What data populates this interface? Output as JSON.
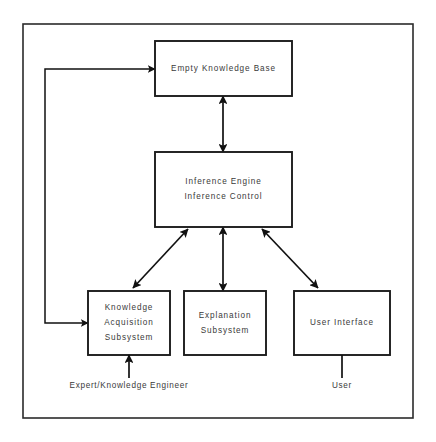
{
  "diagram": {
    "canvas": {
      "width": 436,
      "height": 442
    },
    "frame": {
      "x": 23,
      "y": 24,
      "width": 390,
      "height": 394
    },
    "colors": {
      "background": "#ffffff",
      "box_stroke": "#1c1c1c",
      "frame_stroke": "#2b2b2b",
      "arrow_stroke": "#111111",
      "text": "#3a3a3a"
    },
    "nodes": [
      {
        "id": "empty-knowledge-base",
        "name": "Empty Knowledge Base",
        "lines": [
          "Empty Knowledge Base"
        ],
        "x": 155,
        "y": 41,
        "width": 137,
        "height": 55
      },
      {
        "id": "inference-engine",
        "name": "Inference Engine",
        "lines": [
          "Inference Engine",
          "Inference Control"
        ],
        "x": 155,
        "y": 152,
        "width": 137,
        "height": 75
      },
      {
        "id": "knowledge-acquisition-subsystem",
        "name": "Knowledge Acquisition Subsystem",
        "lines": [
          "Knowledge",
          "Acquisition",
          "Subsystem"
        ],
        "x": 88,
        "y": 291,
        "width": 82,
        "height": 64
      },
      {
        "id": "explanation-subsystem",
        "name": "Explanation Subsystem",
        "lines": [
          "Explanation",
          "Subsystem"
        ],
        "x": 184,
        "y": 291,
        "width": 82,
        "height": 64
      },
      {
        "id": "user-interface",
        "name": "User Interface",
        "lines": [
          "User Interface"
        ],
        "x": 294,
        "y": 291,
        "width": 96,
        "height": 64
      }
    ],
    "connectors": [
      {
        "id": "kb-to-ie",
        "name": "knowledge-base-inference-engine-connector",
        "type": "vertical-double",
        "x": 223,
        "y1": 96,
        "y2": 152
      },
      {
        "id": "ie-to-explanation",
        "name": "inference-engine-explanation-connector",
        "type": "vertical-double",
        "x": 223,
        "y1": 227,
        "y2": 291
      },
      {
        "id": "ie-to-knowledge-acquisition",
        "name": "inference-engine-knowledge-acquisition-connector",
        "type": "diagonal-double",
        "x1": 188,
        "y1": 229,
        "x2": 133,
        "y2": 288
      },
      {
        "id": "ie-to-user-interface",
        "name": "inference-engine-user-interface-connector",
        "type": "diagonal-double",
        "x1": 262,
        "y1": 229,
        "x2": 318,
        "y2": 288
      }
    ],
    "feedback": {
      "id": "knowledge-acquisition-feedback",
      "name": "knowledge-acquisition-feedback-path",
      "description": "Knowledge Acquisition Subsystem to Empty Knowledge Base feedback loop",
      "spine_x": 45,
      "top_y": 69,
      "bottom_y": 323,
      "top_target_x": 155,
      "bottom_target_x": 88
    },
    "captions": [
      {
        "id": "expert-knowledge-engineer",
        "name": "expert-knowledge-engineer-caption",
        "text": "Expert/Knowledge Engineer",
        "label_x": 129,
        "label_y": 386,
        "line_x": 129,
        "line_y1": 378,
        "line_y2": 355,
        "arrow": true
      },
      {
        "id": "user",
        "name": "user-caption",
        "text": "User",
        "label_x": 342,
        "label_y": 386,
        "line_x": 342,
        "line_y1": 378,
        "line_y2": 355,
        "arrow": false
      }
    ]
  }
}
